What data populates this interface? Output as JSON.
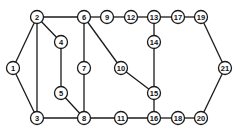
{
  "diagram": {
    "type": "undirected-graph",
    "node_radius": 6.5,
    "colors": {
      "line": "#1a1a1a",
      "node_fill": "#ffffff",
      "label": "#111111",
      "background": "#ffffff"
    },
    "nodes": [
      {
        "id": "1",
        "label": "1",
        "x": 13,
        "y": 68
      },
      {
        "id": "2",
        "label": "2",
        "x": 37,
        "y": 17
      },
      {
        "id": "3",
        "label": "3",
        "x": 37,
        "y": 118
      },
      {
        "id": "4",
        "label": "4",
        "x": 61,
        "y": 42
      },
      {
        "id": "5",
        "label": "5",
        "x": 61,
        "y": 93
      },
      {
        "id": "6",
        "label": "6",
        "x": 84,
        "y": 17
      },
      {
        "id": "7",
        "label": "7",
        "x": 84,
        "y": 68
      },
      {
        "id": "8",
        "label": "8",
        "x": 84,
        "y": 118
      },
      {
        "id": "9",
        "label": "9",
        "x": 107,
        "y": 17
      },
      {
        "id": "10",
        "label": "10",
        "x": 121,
        "y": 68
      },
      {
        "id": "11",
        "label": "11",
        "x": 121,
        "y": 118
      },
      {
        "id": "12",
        "label": "12",
        "x": 131,
        "y": 17
      },
      {
        "id": "13",
        "label": "13",
        "x": 154,
        "y": 17
      },
      {
        "id": "14",
        "label": "14",
        "x": 154,
        "y": 42
      },
      {
        "id": "15",
        "label": "15",
        "x": 154,
        "y": 93
      },
      {
        "id": "16",
        "label": "16",
        "x": 154,
        "y": 118
      },
      {
        "id": "17",
        "label": "17",
        "x": 178,
        "y": 17
      },
      {
        "id": "18",
        "label": "18",
        "x": 178,
        "y": 118
      },
      {
        "id": "19",
        "label": "19",
        "x": 201,
        "y": 17
      },
      {
        "id": "20",
        "label": "20",
        "x": 201,
        "y": 118
      },
      {
        "id": "21",
        "label": "21",
        "x": 225,
        "y": 68
      }
    ],
    "edges": [
      [
        "1",
        "2"
      ],
      [
        "1",
        "3"
      ],
      [
        "2",
        "3"
      ],
      [
        "2",
        "4"
      ],
      [
        "2",
        "6"
      ],
      [
        "4",
        "5"
      ],
      [
        "5",
        "8"
      ],
      [
        "3",
        "8"
      ],
      [
        "6",
        "7"
      ],
      [
        "7",
        "8"
      ],
      [
        "6",
        "9"
      ],
      [
        "6",
        "10"
      ],
      [
        "9",
        "12"
      ],
      [
        "12",
        "13"
      ],
      [
        "13",
        "14"
      ],
      [
        "14",
        "15"
      ],
      [
        "10",
        "15"
      ],
      [
        "15",
        "16"
      ],
      [
        "8",
        "11"
      ],
      [
        "11",
        "16"
      ],
      [
        "16",
        "18"
      ],
      [
        "18",
        "20"
      ],
      [
        "13",
        "17"
      ],
      [
        "17",
        "19"
      ],
      [
        "19",
        "21"
      ],
      [
        "20",
        "21"
      ]
    ]
  }
}
